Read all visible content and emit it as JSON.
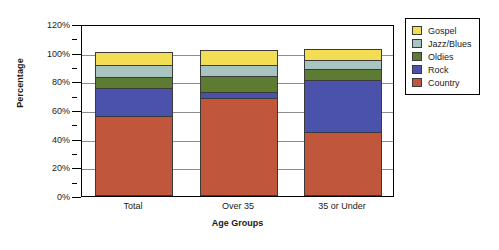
{
  "chart_data": {
    "type": "bar",
    "stacked": true,
    "title": "",
    "xlabel": "Age Groups",
    "ylabel": "Percentage",
    "categories": [
      "Total",
      "Over 35",
      "35 or Under"
    ],
    "ylim": [
      0,
      120
    ],
    "ytick_labels": [
      "0%",
      "20%",
      "40%",
      "60%",
      "80%",
      "100%",
      "120%"
    ],
    "ytick_values": [
      0,
      20,
      40,
      60,
      80,
      100,
      120
    ],
    "yminor_values": [
      10,
      30,
      50,
      70,
      90,
      110
    ],
    "yunit": "%",
    "grid": true,
    "grid_axis": "y",
    "legend_position": "right",
    "series": [
      {
        "name": "Country",
        "color": "#c0563c",
        "values": [
          55,
          68,
          44
        ]
      },
      {
        "name": "Rock",
        "color": "#4a52ab",
        "values": [
          20,
          4,
          36
        ]
      },
      {
        "name": "Oldies",
        "color": "#5d7b32",
        "values": [
          7,
          11,
          8
        ]
      },
      {
        "name": "Jazz/Blues",
        "color": "#a8c4c0",
        "values": [
          9,
          8,
          6
        ]
      },
      {
        "name": "Gospel",
        "color": "#f2dd55",
        "values": [
          9,
          10,
          8
        ]
      }
    ],
    "stack_order_bottom_to_top": [
      "Country",
      "Rock",
      "Oldies",
      "Jazz/Blues",
      "Gospel"
    ],
    "legend_order_top_to_bottom": [
      "Gospel",
      "Jazz/Blues",
      "Oldies",
      "Rock",
      "Country"
    ],
    "totals": [
      100,
      101,
      102
    ]
  },
  "axes": {
    "y_title": "Percentage",
    "x_title": "Age Groups"
  }
}
